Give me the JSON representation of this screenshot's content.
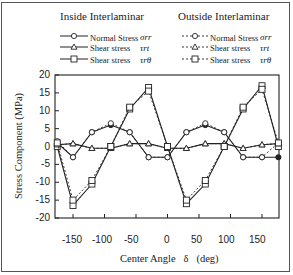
{
  "chart_data": {
    "type": "line",
    "title": "",
    "xlabel": "Center Angle δ (deg)",
    "ylabel": "Stress Component (MPa)",
    "xlim": [
      -180,
      180
    ],
    "ylim": [
      -20,
      20
    ],
    "x_ticks": [
      -150,
      -100,
      -50,
      0,
      50,
      100,
      150
    ],
    "y_ticks": [
      20,
      15,
      10,
      5,
      0,
      -5,
      -10,
      -15,
      -20
    ],
    "grid": false,
    "legend_groups": [
      {
        "title": "Inside Interlaminar",
        "line_style": "solid"
      },
      {
        "title": "Outside Interlaminar",
        "line_style": "dashed"
      }
    ],
    "x": [
      -180,
      -150,
      -120,
      -90,
      -60,
      -30,
      0,
      30,
      60,
      90,
      120,
      150,
      180
    ],
    "series": [
      {
        "name": "Inside Normal Stress σrr",
        "group": "Inside Interlaminar",
        "marker": "circle-filled",
        "style": "solid",
        "values": [
          1.0,
          -3.0,
          4.0,
          6.0,
          4.0,
          -3.0,
          -3.0,
          4.0,
          6.0,
          4.0,
          -3.0,
          -3.0,
          -3.0
        ]
      },
      {
        "name": "Inside Shear stress τrt",
        "group": "Inside Interlaminar",
        "marker": "triangle",
        "style": "solid",
        "values": [
          0.5,
          0.8,
          -0.5,
          -0.5,
          0.8,
          0.8,
          -0.5,
          -0.5,
          0.8,
          0.8,
          -0.5,
          0.5,
          0.8
        ]
      },
      {
        "name": "Inside Shear stress τrθ",
        "group": "Inside Interlaminar",
        "marker": "square",
        "style": "solid",
        "values": [
          0.0,
          -16.5,
          -10.5,
          0.0,
          10.5,
          16.5,
          0.0,
          -16.0,
          -10.5,
          0.0,
          10.5,
          17.0,
          0.0
        ]
      },
      {
        "name": "Outside Normal Stress σrr",
        "group": "Outside Interlaminar",
        "marker": "circle-open",
        "style": "dashed",
        "values": [
          1.5,
          -3.0,
          4.0,
          6.5,
          4.0,
          -3.0,
          -3.0,
          4.0,
          6.5,
          4.0,
          -3.0,
          -3.0,
          1.0
        ]
      },
      {
        "name": "Outside Shear stress τrt",
        "group": "Outside Interlaminar",
        "marker": "triangle",
        "style": "dashed",
        "values": [
          0.5,
          0.8,
          -0.5,
          -0.5,
          0.8,
          0.8,
          -0.5,
          -0.5,
          0.8,
          0.8,
          -0.5,
          0.5,
          0.8
        ]
      },
      {
        "name": "Outside Shear stress τrθ",
        "group": "Outside Interlaminar",
        "marker": "square",
        "style": "dashed",
        "values": [
          1.0,
          -15.0,
          -9.5,
          0.0,
          11.0,
          15.5,
          0.0,
          -15.0,
          -9.5,
          0.0,
          11.0,
          16.0,
          1.0
        ]
      }
    ]
  },
  "legend": {
    "inside": {
      "title": "Inside Interlaminar",
      "items": [
        {
          "label": "Normal Stress",
          "symbol": "σrr"
        },
        {
          "label": "Shear stress",
          "symbol": "τrt"
        },
        {
          "label": "Shear stress",
          "symbol": "τrθ"
        }
      ]
    },
    "outside": {
      "title": "Outside Interlaminar",
      "items": [
        {
          "label": "Normal Stress",
          "symbol": "σrr"
        },
        {
          "label": "Shear stress",
          "symbol": "τrt"
        },
        {
          "label": "Shear stress",
          "symbol": "τrθ"
        }
      ]
    }
  },
  "axes": {
    "x_title": "Center Angle   δ   (deg)",
    "y_title": "Stress Component (MPa)",
    "x_tick_labels": [
      "-150",
      "-100",
      "-50",
      "0",
      "50",
      "100",
      "150"
    ],
    "y_tick_labels": [
      "20",
      "15",
      "10",
      "5",
      "0",
      "-5",
      "-10",
      "-15",
      "-20"
    ]
  }
}
